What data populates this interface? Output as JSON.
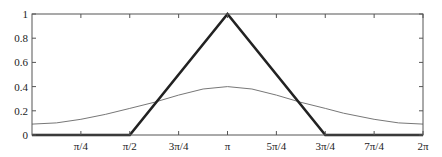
{
  "chart_data": {
    "type": "line",
    "title": "",
    "xlabel": "",
    "ylabel": "",
    "xlim": [
      0,
      6.2832
    ],
    "ylim": [
      0,
      1
    ],
    "grid": false,
    "legend": null,
    "x_tick_labels": [
      "π/4",
      "π/2",
      "3π/4",
      "π",
      "5π/4",
      "3π/4",
      "7π/4",
      "2π"
    ],
    "x_tick_values": [
      0.7854,
      1.5708,
      2.3562,
      3.1416,
      3.927,
      4.7124,
      5.4978,
      6.2832
    ],
    "y_tick_labels": [
      "0",
      "0.2",
      "0.4",
      "0.6",
      "0.8",
      "1"
    ],
    "y_tick_values": [
      0,
      0.2,
      0.4,
      0.6,
      0.8,
      1
    ],
    "series": [
      {
        "name": "triangle (thick)",
        "style": "thick black",
        "x": [
          0,
          1.5708,
          3.1416,
          4.7124,
          6.2832
        ],
        "y": [
          0,
          0,
          1,
          0,
          0
        ]
      },
      {
        "name": "gaussian (thin)",
        "style": "thin gray",
        "x": [
          0,
          0.3927,
          0.7854,
          1.1781,
          1.5708,
          1.9635,
          2.3562,
          2.7489,
          3.1416,
          3.5343,
          3.927,
          4.3197,
          4.7124,
          5.0051,
          5.4978,
          5.8905,
          6.2832
        ],
        "y": [
          0.09,
          0.1,
          0.13,
          0.17,
          0.22,
          0.27,
          0.33,
          0.38,
          0.4,
          0.38,
          0.33,
          0.27,
          0.22,
          0.18,
          0.13,
          0.1,
          0.09
        ]
      }
    ]
  }
}
